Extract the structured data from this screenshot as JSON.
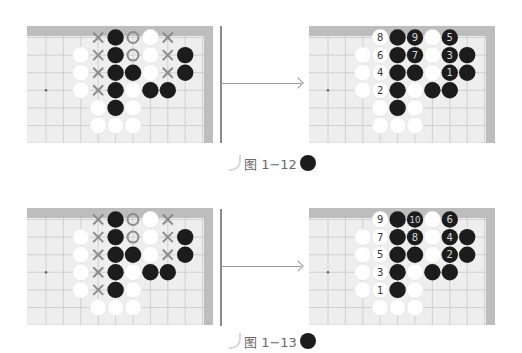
{
  "figures": [
    {
      "caption": "图 1−12",
      "left_board": {
        "marks": [
          {
            "r": 0,
            "c": 3,
            "t": "X"
          },
          {
            "r": 0,
            "c": 4,
            "t": "B"
          },
          {
            "r": 0,
            "c": 5,
            "t": "O"
          },
          {
            "r": 0,
            "c": 6,
            "t": "W"
          },
          {
            "r": 0,
            "c": 7,
            "t": "X"
          },
          {
            "r": 1,
            "c": 2,
            "t": "W"
          },
          {
            "r": 1,
            "c": 3,
            "t": "X"
          },
          {
            "r": 1,
            "c": 4,
            "t": "B"
          },
          {
            "r": 1,
            "c": 5,
            "t": "O"
          },
          {
            "r": 1,
            "c": 6,
            "t": "W"
          },
          {
            "r": 1,
            "c": 7,
            "t": "X"
          },
          {
            "r": 1,
            "c": 8,
            "t": "B"
          },
          {
            "r": 2,
            "c": 2,
            "t": "W"
          },
          {
            "r": 2,
            "c": 3,
            "t": "X"
          },
          {
            "r": 2,
            "c": 4,
            "t": "B"
          },
          {
            "r": 2,
            "c": 5,
            "t": "B"
          },
          {
            "r": 2,
            "c": 6,
            "t": "W"
          },
          {
            "r": 2,
            "c": 7,
            "t": "X"
          },
          {
            "r": 2,
            "c": 8,
            "t": "B"
          },
          {
            "r": 3,
            "c": 2,
            "t": "W"
          },
          {
            "r": 3,
            "c": 3,
            "t": "X"
          },
          {
            "r": 3,
            "c": 4,
            "t": "B"
          },
          {
            "r": 3,
            "c": 5,
            "t": "W"
          },
          {
            "r": 3,
            "c": 6,
            "t": "B"
          },
          {
            "r": 3,
            "c": 7,
            "t": "B"
          },
          {
            "r": 4,
            "c": 3,
            "t": "W"
          },
          {
            "r": 4,
            "c": 4,
            "t": "B"
          },
          {
            "r": 4,
            "c": 5,
            "t": "W"
          },
          {
            "r": 5,
            "c": 3,
            "t": "W"
          },
          {
            "r": 5,
            "c": 4,
            "t": "W"
          },
          {
            "r": 5,
            "c": 5,
            "t": "W"
          }
        ]
      },
      "right_board": {
        "marks": [
          {
            "r": 0,
            "c": 3,
            "t": "W",
            "n": "8"
          },
          {
            "r": 0,
            "c": 4,
            "t": "B"
          },
          {
            "r": 0,
            "c": 5,
            "t": "B",
            "n": "9"
          },
          {
            "r": 0,
            "c": 6,
            "t": "W"
          },
          {
            "r": 0,
            "c": 7,
            "t": "B",
            "n": "5"
          },
          {
            "r": 1,
            "c": 2,
            "t": "W"
          },
          {
            "r": 1,
            "c": 3,
            "t": "W",
            "n": "6"
          },
          {
            "r": 1,
            "c": 4,
            "t": "B"
          },
          {
            "r": 1,
            "c": 5,
            "t": "B",
            "n": "7"
          },
          {
            "r": 1,
            "c": 6,
            "t": "W"
          },
          {
            "r": 1,
            "c": 7,
            "t": "B",
            "n": "3"
          },
          {
            "r": 1,
            "c": 8,
            "t": "B"
          },
          {
            "r": 2,
            "c": 2,
            "t": "W"
          },
          {
            "r": 2,
            "c": 3,
            "t": "W",
            "n": "4"
          },
          {
            "r": 2,
            "c": 4,
            "t": "B"
          },
          {
            "r": 2,
            "c": 5,
            "t": "B"
          },
          {
            "r": 2,
            "c": 6,
            "t": "W"
          },
          {
            "r": 2,
            "c": 7,
            "t": "B",
            "n": "1"
          },
          {
            "r": 2,
            "c": 8,
            "t": "B"
          },
          {
            "r": 3,
            "c": 2,
            "t": "W"
          },
          {
            "r": 3,
            "c": 3,
            "t": "W",
            "n": "2"
          },
          {
            "r": 3,
            "c": 4,
            "t": "B"
          },
          {
            "r": 3,
            "c": 5,
            "t": "W"
          },
          {
            "r": 3,
            "c": 6,
            "t": "B"
          },
          {
            "r": 3,
            "c": 7,
            "t": "B"
          },
          {
            "r": 4,
            "c": 3,
            "t": "W"
          },
          {
            "r": 4,
            "c": 4,
            "t": "B"
          },
          {
            "r": 4,
            "c": 5,
            "t": "W"
          },
          {
            "r": 5,
            "c": 3,
            "t": "W"
          },
          {
            "r": 5,
            "c": 4,
            "t": "W"
          },
          {
            "r": 5,
            "c": 5,
            "t": "W"
          }
        ]
      }
    },
    {
      "caption": "图 1−13",
      "left_board": {
        "marks": [
          {
            "r": 0,
            "c": 3,
            "t": "X"
          },
          {
            "r": 0,
            "c": 4,
            "t": "B"
          },
          {
            "r": 0,
            "c": 5,
            "t": "O"
          },
          {
            "r": 0,
            "c": 6,
            "t": "W"
          },
          {
            "r": 0,
            "c": 7,
            "t": "X"
          },
          {
            "r": 1,
            "c": 2,
            "t": "W"
          },
          {
            "r": 1,
            "c": 3,
            "t": "X"
          },
          {
            "r": 1,
            "c": 4,
            "t": "B"
          },
          {
            "r": 1,
            "c": 5,
            "t": "O"
          },
          {
            "r": 1,
            "c": 6,
            "t": "W"
          },
          {
            "r": 1,
            "c": 7,
            "t": "X"
          },
          {
            "r": 1,
            "c": 8,
            "t": "B"
          },
          {
            "r": 2,
            "c": 2,
            "t": "W"
          },
          {
            "r": 2,
            "c": 3,
            "t": "X"
          },
          {
            "r": 2,
            "c": 4,
            "t": "B"
          },
          {
            "r": 2,
            "c": 5,
            "t": "B"
          },
          {
            "r": 2,
            "c": 6,
            "t": "W"
          },
          {
            "r": 2,
            "c": 7,
            "t": "X"
          },
          {
            "r": 2,
            "c": 8,
            "t": "B"
          },
          {
            "r": 3,
            "c": 2,
            "t": "W"
          },
          {
            "r": 3,
            "c": 3,
            "t": "X"
          },
          {
            "r": 3,
            "c": 4,
            "t": "B"
          },
          {
            "r": 3,
            "c": 5,
            "t": "W"
          },
          {
            "r": 3,
            "c": 6,
            "t": "B"
          },
          {
            "r": 3,
            "c": 7,
            "t": "B"
          },
          {
            "r": 4,
            "c": 2,
            "t": "W"
          },
          {
            "r": 4,
            "c": 3,
            "t": "X"
          },
          {
            "r": 4,
            "c": 4,
            "t": "B"
          },
          {
            "r": 4,
            "c": 5,
            "t": "W"
          },
          {
            "r": 5,
            "c": 3,
            "t": "W"
          },
          {
            "r": 5,
            "c": 4,
            "t": "W"
          },
          {
            "r": 5,
            "c": 5,
            "t": "W"
          }
        ]
      },
      "right_board": {
        "marks": [
          {
            "r": 0,
            "c": 3,
            "t": "W",
            "n": "9"
          },
          {
            "r": 0,
            "c": 4,
            "t": "B"
          },
          {
            "r": 0,
            "c": 5,
            "t": "B",
            "n": "10"
          },
          {
            "r": 0,
            "c": 6,
            "t": "W"
          },
          {
            "r": 0,
            "c": 7,
            "t": "B",
            "n": "6"
          },
          {
            "r": 1,
            "c": 2,
            "t": "W"
          },
          {
            "r": 1,
            "c": 3,
            "t": "W",
            "n": "7"
          },
          {
            "r": 1,
            "c": 4,
            "t": "B"
          },
          {
            "r": 1,
            "c": 5,
            "t": "B",
            "n": "8"
          },
          {
            "r": 1,
            "c": 6,
            "t": "W"
          },
          {
            "r": 1,
            "c": 7,
            "t": "B",
            "n": "4"
          },
          {
            "r": 1,
            "c": 8,
            "t": "B"
          },
          {
            "r": 2,
            "c": 2,
            "t": "W"
          },
          {
            "r": 2,
            "c": 3,
            "t": "W",
            "n": "5"
          },
          {
            "r": 2,
            "c": 4,
            "t": "B"
          },
          {
            "r": 2,
            "c": 5,
            "t": "B"
          },
          {
            "r": 2,
            "c": 6,
            "t": "W"
          },
          {
            "r": 2,
            "c": 7,
            "t": "B",
            "n": "2"
          },
          {
            "r": 2,
            "c": 8,
            "t": "B"
          },
          {
            "r": 3,
            "c": 2,
            "t": "W"
          },
          {
            "r": 3,
            "c": 3,
            "t": "W",
            "n": "3"
          },
          {
            "r": 3,
            "c": 4,
            "t": "B"
          },
          {
            "r": 3,
            "c": 5,
            "t": "W"
          },
          {
            "r": 3,
            "c": 6,
            "t": "B"
          },
          {
            "r": 3,
            "c": 7,
            "t": "B"
          },
          {
            "r": 4,
            "c": 2,
            "t": "W"
          },
          {
            "r": 4,
            "c": 3,
            "t": "W",
            "n": "1"
          },
          {
            "r": 4,
            "c": 4,
            "t": "B"
          },
          {
            "r": 4,
            "c": 5,
            "t": "W"
          },
          {
            "r": 5,
            "c": 3,
            "t": "W"
          },
          {
            "r": 5,
            "c": 4,
            "t": "W"
          },
          {
            "r": 5,
            "c": 5,
            "t": "W"
          }
        ]
      }
    }
  ],
  "legend": {
    "X": "gray cross mark",
    "O": "gray ring mark",
    "B": "black stone",
    "W": "white stone"
  },
  "colors": {
    "black_stone": "#1c1c1c",
    "white_stone": "#ffffff",
    "mark": "#8c8c8c",
    "board": "#eeeeee",
    "board_edge": "#bdbdbd",
    "grid": "#c9c9c9"
  }
}
